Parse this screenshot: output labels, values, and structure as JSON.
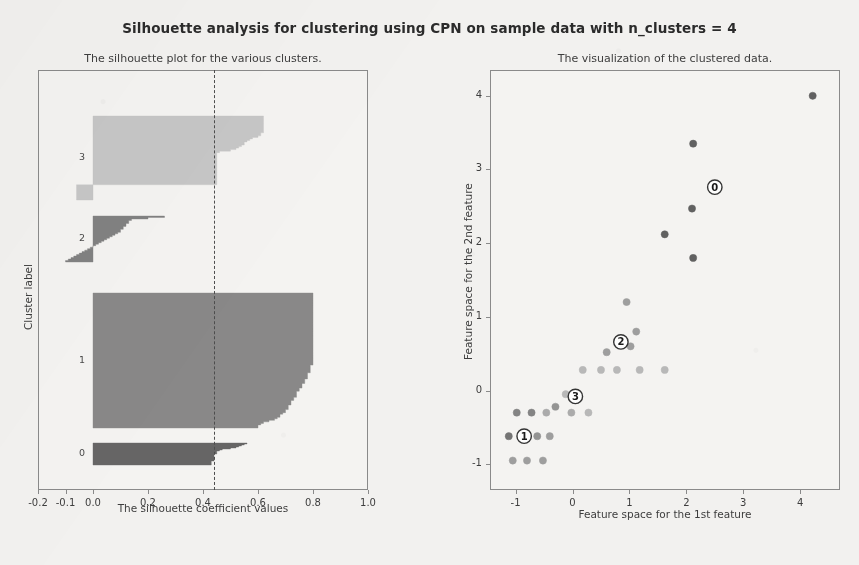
{
  "figure": {
    "title": "Silhouette analysis for clustering using CPN on sample data with n_clusters = 4",
    "background_color": "#f2f1ef",
    "n_clusters": 4
  },
  "chart_data": [
    {
      "type": "area",
      "name": "silhouette-plot",
      "title": "The silhouette plot for the various clusters.",
      "xlabel": "The silhouette coefficient values",
      "ylabel": "Cluster label",
      "xlim": [
        -0.2,
        1.0
      ],
      "xticks": [
        -0.2,
        -0.1,
        0.0,
        0.2,
        0.4,
        0.6,
        0.8,
        1.0
      ],
      "xticklabels": [
        "-0.2",
        "-0.1",
        "0.0",
        "0.2",
        "0.4",
        "0.6",
        "0.8",
        "1.0"
      ],
      "yticks": [],
      "grid": false,
      "average_silhouette_score": 0.44,
      "average_line_style": "dashed",
      "average_line_color": "#4d4d4d",
      "cluster_labels": [
        "0",
        "1",
        "2",
        "3"
      ],
      "clusters": [
        {
          "label": "0",
          "color": "#5a5a5a",
          "y_top_px": 443,
          "y_bottom_px": 465,
          "silhouette_values": [
            0.56,
            0.55,
            0.54,
            0.53,
            0.52,
            0.5,
            0.47,
            0.46,
            0.45,
            0.45,
            0.45,
            0.44,
            0.44,
            0.44,
            0.44,
            0.44,
            0.44,
            0.44,
            0.43,
            0.43,
            0.43,
            0.43
          ]
        },
        {
          "label": "1",
          "color": "#808080",
          "y_top_px": 293,
          "y_bottom_px": 428,
          "silhouette_values": [
            0.8,
            0.8,
            0.8,
            0.8,
            0.8,
            0.8,
            0.8,
            0.8,
            0.8,
            0.8,
            0.8,
            0.8,
            0.8,
            0.8,
            0.8,
            0.8,
            0.8,
            0.8,
            0.8,
            0.8,
            0.8,
            0.8,
            0.8,
            0.8,
            0.8,
            0.8,
            0.8,
            0.8,
            0.8,
            0.8,
            0.8,
            0.8,
            0.8,
            0.8,
            0.8,
            0.8,
            0.8,
            0.8,
            0.8,
            0.8,
            0.8,
            0.8,
            0.8,
            0.8,
            0.8,
            0.8,
            0.8,
            0.79,
            0.79,
            0.79,
            0.79,
            0.79,
            0.78,
            0.78,
            0.78,
            0.78,
            0.77,
            0.77,
            0.77,
            0.76,
            0.76,
            0.76,
            0.75,
            0.75,
            0.74,
            0.74,
            0.74,
            0.74,
            0.73,
            0.73,
            0.72,
            0.72,
            0.72,
            0.71,
            0.71,
            0.71,
            0.7,
            0.7,
            0.69,
            0.68,
            0.68,
            0.67,
            0.66,
            0.64,
            0.62,
            0.61,
            0.6,
            0.6
          ]
        },
        {
          "label": "2",
          "color": "#787878",
          "y_top_px": 216,
          "y_bottom_px": 262,
          "silhouette_values": [
            0.26,
            0.2,
            0.14,
            0.13,
            0.13,
            0.12,
            0.12,
            0.11,
            0.11,
            0.1,
            0.1,
            0.09,
            0.08,
            0.07,
            0.06,
            0.05,
            0.04,
            0.03,
            0.02,
            0.01,
            0.0,
            -0.01,
            -0.02,
            -0.03,
            -0.04,
            -0.05,
            -0.06,
            -0.07,
            -0.08,
            -0.09,
            -0.1
          ]
        },
        {
          "label": "3",
          "color": "#c3c3c3",
          "y_top_px": 116,
          "y_bottom_px": 200,
          "silhouette_values": [
            0.62,
            0.62,
            0.62,
            0.62,
            0.62,
            0.62,
            0.62,
            0.62,
            0.62,
            0.62,
            0.62,
            0.61,
            0.61,
            0.6,
            0.58,
            0.57,
            0.56,
            0.55,
            0.55,
            0.54,
            0.53,
            0.52,
            0.5,
            0.46,
            0.45,
            0.45,
            0.45,
            0.45,
            0.45,
            0.45,
            0.45,
            0.45,
            0.45,
            0.45,
            0.45,
            0.45,
            0.45,
            0.45,
            0.45,
            0.45,
            0.45,
            0.45,
            0.45,
            0.45,
            0.45,
            -0.06,
            -0.06,
            -0.06,
            -0.06,
            -0.06,
            -0.06,
            -0.06,
            -0.06,
            -0.06,
            -0.06
          ]
        }
      ]
    },
    {
      "type": "scatter",
      "name": "cluster-visualization",
      "title": "The visualization of the clustered data.",
      "xlabel": "Feature space for the 1st feature",
      "ylabel": "Feature space for the 2nd feature",
      "xlim": [
        -1.45,
        4.7
      ],
      "ylim": [
        -1.35,
        4.35
      ],
      "xticks": [
        -1,
        0,
        1,
        2,
        3,
        4
      ],
      "xticklabels": [
        "-1",
        "0",
        "1",
        "2",
        "3",
        "4"
      ],
      "yticks": [
        -1,
        0,
        1,
        2,
        3,
        4
      ],
      "yticklabels": [
        "-1",
        "0",
        "1",
        "2",
        "3",
        "4"
      ],
      "grid": false,
      "points": [
        {
          "x": 4.22,
          "y": 4.0,
          "c": "#5a5a5a"
        },
        {
          "x": 2.12,
          "y": 3.35,
          "c": "#5a5a5a"
        },
        {
          "x": 1.62,
          "y": 2.12,
          "c": "#5a5a5a"
        },
        {
          "x": 2.1,
          "y": 2.47,
          "c": "#5a5a5a"
        },
        {
          "x": 2.12,
          "y": 1.8,
          "c": "#5a5a5a"
        },
        {
          "x": 0.95,
          "y": 1.2,
          "c": "#9a9a9a"
        },
        {
          "x": 1.12,
          "y": 0.8,
          "c": "#9a9a9a"
        },
        {
          "x": 1.02,
          "y": 0.6,
          "c": "#9a9a9a"
        },
        {
          "x": 0.6,
          "y": 0.52,
          "c": "#9a9a9a"
        },
        {
          "x": 0.18,
          "y": 0.28,
          "c": "#b5b5b5"
        },
        {
          "x": 0.5,
          "y": 0.28,
          "c": "#b5b5b5"
        },
        {
          "x": 0.78,
          "y": 0.28,
          "c": "#b5b5b5"
        },
        {
          "x": 1.18,
          "y": 0.28,
          "c": "#b5b5b5"
        },
        {
          "x": 1.62,
          "y": 0.28,
          "c": "#b5b5b5"
        },
        {
          "x": -0.12,
          "y": -0.05,
          "c": "#b5b5b5"
        },
        {
          "x": -0.3,
          "y": -0.22,
          "c": "#8f8f8f"
        },
        {
          "x": -0.98,
          "y": -0.3,
          "c": "#7f7f7f"
        },
        {
          "x": -0.72,
          "y": -0.3,
          "c": "#7f7f7f"
        },
        {
          "x": -0.46,
          "y": -0.3,
          "c": "#a8a8a8"
        },
        {
          "x": -0.02,
          "y": -0.3,
          "c": "#a8a8a8"
        },
        {
          "x": 0.28,
          "y": -0.3,
          "c": "#b5b5b5"
        },
        {
          "x": -1.12,
          "y": -0.62,
          "c": "#6e6e6e"
        },
        {
          "x": -0.62,
          "y": -0.62,
          "c": "#8f8f8f"
        },
        {
          "x": -0.4,
          "y": -0.62,
          "c": "#9a9a9a"
        },
        {
          "x": -1.05,
          "y": -0.95,
          "c": "#9a9a9a"
        },
        {
          "x": -0.8,
          "y": -0.95,
          "c": "#9a9a9a"
        },
        {
          "x": -0.52,
          "y": -0.95,
          "c": "#9a9a9a"
        }
      ],
      "centers": [
        {
          "label": "0",
          "x": 2.5,
          "y": 2.76
        },
        {
          "label": "1",
          "x": -0.85,
          "y": -0.62
        },
        {
          "label": "2",
          "x": 0.85,
          "y": 0.66
        },
        {
          "label": "3",
          "x": 0.05,
          "y": -0.08
        }
      ]
    }
  ]
}
